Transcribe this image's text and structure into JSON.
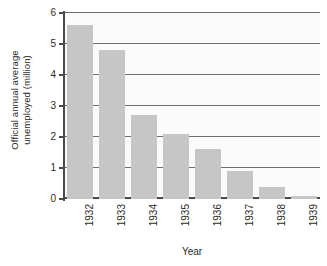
{
  "chart_data": {
    "type": "bar",
    "title": "",
    "xlabel": "Year",
    "ylabel_line1": "Official annual average",
    "ylabel_line2": "unemployed (million)",
    "ylabel": "Official annual average unemployed (million)",
    "categories": [
      "1932",
      "1933",
      "1934",
      "1935",
      "1936",
      "1937",
      "1938",
      "1939"
    ],
    "values": [
      5.6,
      4.8,
      2.7,
      2.1,
      1.6,
      0.9,
      0.4,
      0.1
    ],
    "series": [
      {
        "name": "Official annual average unemployed (million)",
        "values": [
          5.6,
          4.8,
          2.7,
          2.1,
          1.6,
          0.9,
          0.4,
          0.1
        ]
      }
    ],
    "ylim": [
      0,
      6
    ],
    "yticks": [
      0,
      1,
      2,
      3,
      4,
      5,
      6
    ],
    "ytick_labels": [
      "0",
      "1",
      "2",
      "3",
      "4",
      "5",
      "6"
    ],
    "grid": "horizontal",
    "legend": "none",
    "bar_color": "#c6c6c6",
    "grid_color": "#6e6e6e",
    "axis_color": "#4a4a4a",
    "plot_background": "#fbfbfb",
    "figure_background": "#ffffff",
    "xtick_rotation": 90
  }
}
